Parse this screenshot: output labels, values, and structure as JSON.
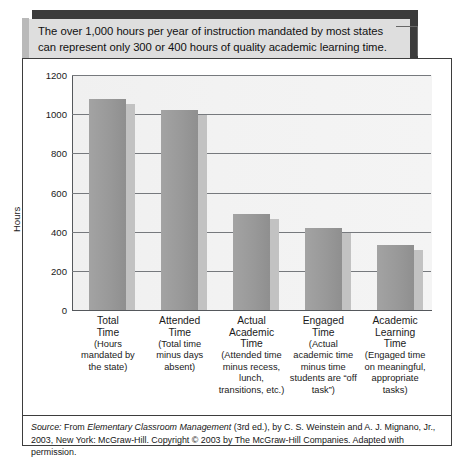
{
  "callout": {
    "text": "The over 1,000 hours per year of instruction mandated by most states can represent only 300 or 400 hours of quality academic learning time."
  },
  "source": {
    "label": "Source:",
    "prefix": " From ",
    "title": "Elementary Classroom Management",
    "rest": " (3rd ed.), by C. S. Weinstein and A. J. Mignano, Jr., 2003, New York: McGraw-Hill. Copyright © 2003 by The McGraw-Hill Companies. Adapted with permission."
  },
  "chart_data": {
    "type": "bar",
    "title": "",
    "xlabel": "",
    "ylabel": "Hours",
    "ylim": [
      0,
      1200
    ],
    "yticks": [
      0,
      200,
      400,
      600,
      800,
      1000,
      1200
    ],
    "ytick_labels": [
      "0",
      "200",
      "400",
      "600",
      "800",
      "1000",
      "1200"
    ],
    "grid": true,
    "legend": false,
    "categories": [
      "Total Time",
      "Attended Time",
      "Actual Academic Time",
      "Engaged Time",
      "Academic Learning Time"
    ],
    "category_names": [
      "Total\nTime",
      "Attended\nTime",
      "Actual\nAcademic\nTime",
      "Engaged\nTime",
      "Academic\nLearning\nTime"
    ],
    "category_descriptions": [
      "(Hours mandated by the state)",
      "(Total time minus days absent)",
      "(Attended time minus recess, lunch, transitions, etc.)",
      "(Actual academic time minus time students are “off task”)",
      "(Engaged time on meaningful, appropriate tasks)"
    ],
    "values": [
      1080,
      1020,
      490,
      420,
      330
    ],
    "bar_color": "#999999",
    "shadow_color": "#c2c2c2",
    "plot_background": "#f2f2f2"
  }
}
